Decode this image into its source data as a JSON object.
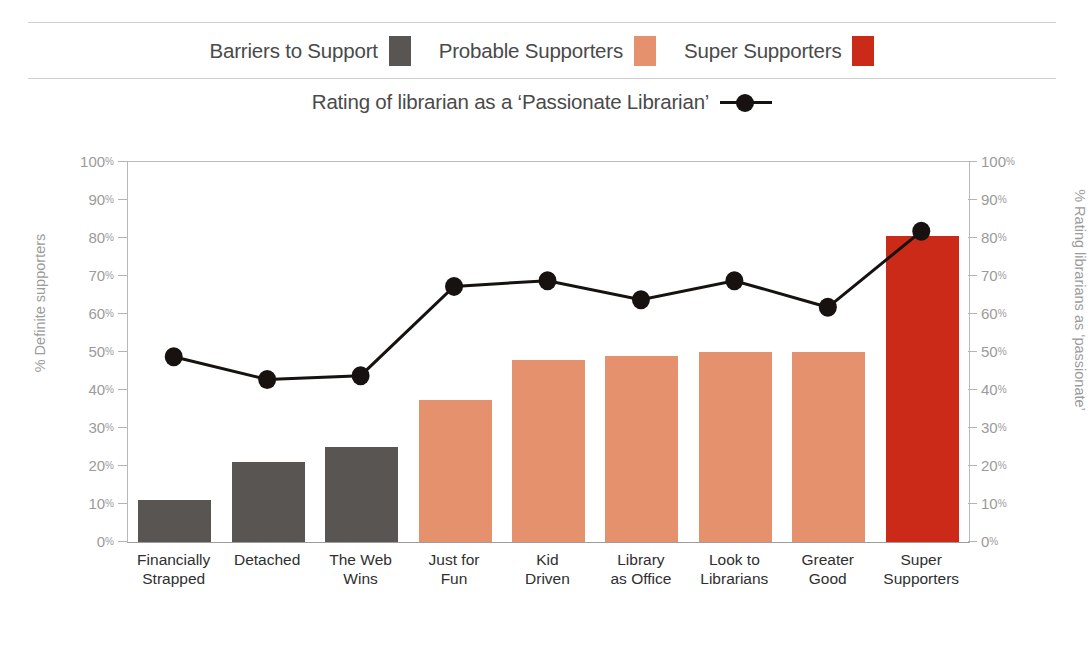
{
  "top_caption": "",
  "bottom_caption": "",
  "legend": {
    "bars": [
      {
        "label": "Barriers to Support",
        "color": "#585552",
        "icon": "legend-swatch-gray"
      },
      {
        "label": "Probable Supporters",
        "color": "#e5916e",
        "icon": "legend-swatch-salmon"
      },
      {
        "label": "Super Supporters",
        "color": "#cc2a18",
        "icon": "legend-swatch-red"
      }
    ],
    "line": {
      "label": "Rating of librarian as a ‘Passionate Librarian’",
      "color": "#17120f",
      "icon": "line-marker-key"
    }
  },
  "axes": {
    "left_title": "% Definite supporters",
    "right_title": "% Rating librarians as ‘passionate’",
    "ticks": [
      "100",
      "90",
      "80",
      "70",
      "60",
      "50",
      "40",
      "30",
      "20",
      "10",
      "0"
    ],
    "percent_sign": "%"
  },
  "chart_data": {
    "type": "bar",
    "title": "",
    "xlabel": "",
    "ylabel": "% Definite supporters",
    "y2label": "% Rating librarians as ‘passionate’",
    "ylim": [
      0,
      100
    ],
    "y2lim": [
      0,
      100
    ],
    "grid": false,
    "legend_position": "top",
    "categories": [
      "Financially Strapped",
      "Detached",
      "The Web Wins",
      "Just for Fun",
      "Kid Driven",
      "Library as Office",
      "Look to Librarians",
      "Greater Good",
      "Super Supporters"
    ],
    "category_lines": [
      [
        "Financially",
        "Strapped"
      ],
      [
        "Detached",
        ""
      ],
      [
        "The Web",
        "Wins"
      ],
      [
        "Just for",
        "Fun"
      ],
      [
        "Kid",
        "Driven"
      ],
      [
        "Library",
        "as Office"
      ],
      [
        "Look to",
        "Librarians"
      ],
      [
        "Greater",
        "Good"
      ],
      [
        "Super",
        "Supporters"
      ]
    ],
    "series": [
      {
        "name": "% Definite supporters",
        "type": "bar",
        "axis": "left",
        "values": [
          11,
          21,
          25,
          37.5,
          48,
          49,
          50,
          50,
          80.5
        ],
        "colors": [
          "#585552",
          "#585552",
          "#585552",
          "#e5916e",
          "#e5916e",
          "#e5916e",
          "#e5916e",
          "#e5916e",
          "#cc2a18"
        ],
        "groups": [
          "Barriers to Support",
          "Barriers to Support",
          "Barriers to Support",
          "Probable Supporters",
          "Probable Supporters",
          "Probable Supporters",
          "Probable Supporters",
          "Probable Supporters",
          "Super Supporters"
        ]
      },
      {
        "name": "Rating of librarian as a ‘Passionate Librarian’",
        "type": "line",
        "axis": "right",
        "color": "#17120f",
        "values": [
          48.5,
          42.5,
          43.5,
          67,
          68.5,
          63.5,
          68.5,
          61.5,
          81.5
        ]
      }
    ]
  }
}
